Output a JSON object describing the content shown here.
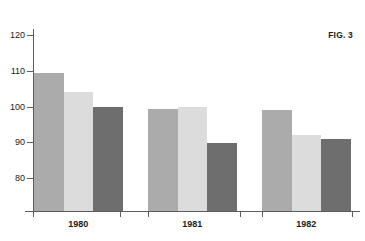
{
  "figure": {
    "label": "FIG. 3"
  },
  "chart_data": {
    "type": "bar",
    "title": "FIG. 3",
    "xlabel": "",
    "ylabel": "",
    "ylim": [
      72,
      124
    ],
    "grid": false,
    "legend": "none",
    "categories": [
      "1980",
      "1981",
      "1982"
    ],
    "yticks": [
      80,
      90,
      100,
      110,
      120
    ],
    "ytick_labels": [
      "80",
      "90",
      "100",
      "110",
      "120"
    ],
    "series": [
      {
        "name": "Series A",
        "color": "#ababab",
        "values": [
          109.5,
          99.2,
          99.0
        ]
      },
      {
        "name": "Series B",
        "color": "#dcdcdc",
        "values": [
          104.0,
          99.8,
          92.0
        ]
      },
      {
        "name": "Series C",
        "color": "#6e6e6e",
        "values": [
          99.8,
          89.7,
          91.0
        ]
      }
    ]
  },
  "axis": {
    "y_labels": [
      "120",
      "110",
      "100",
      "90",
      "80"
    ],
    "x_labels": [
      "1980",
      "1981",
      "1982"
    ]
  }
}
